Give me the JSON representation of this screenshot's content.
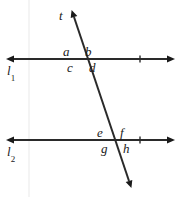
{
  "figure": {
    "background_color": "#ffffff",
    "stroke_color": "#1a1a1a",
    "width": 178,
    "height": 197
  },
  "lines": {
    "l1": {
      "label": "l",
      "subscript": "1",
      "name": "line-l1",
      "y": 59,
      "x_start": 11,
      "x_end": 170,
      "tick_x": 140,
      "arrows": "both"
    },
    "l2": {
      "label": "l",
      "subscript": "2",
      "name": "line-l2",
      "y": 140,
      "x_start": 11,
      "x_end": 170,
      "tick_x": 140,
      "arrows": "both"
    },
    "transversal": {
      "label": "t",
      "name": "transversal-t",
      "x_top": 72,
      "y_top": 13,
      "x_bottom": 131,
      "y_bottom": 185,
      "arrows": "both"
    }
  },
  "intersections": {
    "upper": {
      "x": 80,
      "y": 59
    },
    "lower": {
      "x": 114,
      "y": 140
    }
  },
  "angle_labels": [
    {
      "id": "a",
      "text": "a",
      "x": 63,
      "y": 46,
      "position": "upper-left-of-upper-intersection"
    },
    {
      "id": "b",
      "text": "b",
      "x": 84,
      "y": 46,
      "position": "upper-right-of-upper-intersection"
    },
    {
      "id": "c",
      "text": "c",
      "x": 67,
      "y": 62,
      "position": "lower-left-of-upper-intersection"
    },
    {
      "id": "d",
      "text": "d",
      "x": 88,
      "y": 62,
      "position": "lower-right-of-upper-intersection"
    },
    {
      "id": "e",
      "text": "e",
      "x": 97,
      "y": 127,
      "position": "upper-left-of-lower-intersection"
    },
    {
      "id": "f",
      "text": "f",
      "x": 119,
      "y": 127,
      "position": "upper-right-of-lower-intersection"
    },
    {
      "id": "g",
      "text": "g",
      "x": 101,
      "y": 143,
      "position": "lower-left-of-lower-intersection"
    },
    {
      "id": "h",
      "text": "h",
      "x": 122,
      "y": 143,
      "position": "lower-right-of-lower-intersection"
    }
  ],
  "line_labels": {
    "l1": {
      "x": 7,
      "y": 64
    },
    "l2": {
      "x": 7,
      "y": 145
    },
    "t": {
      "x": 59,
      "y": 9
    }
  }
}
